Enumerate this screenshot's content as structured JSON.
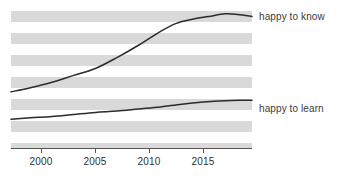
{
  "chart_data": {
    "type": "line",
    "title": "",
    "subtitle": "",
    "xlabel": "",
    "ylabel": "",
    "xlim": [
      1997.2,
      1919.5
    ],
    "x_range": [
      1997.2,
      2019.5
    ],
    "ylim": [
      0,
      100
    ],
    "grid": "horizontal-alternating-bands",
    "legend_position": "right-of-plot-inline",
    "x_tick_labels": [
      "2000",
      "2005",
      "2010",
      "2015"
    ],
    "x_ticks": [
      2000,
      2005,
      2010,
      2015
    ],
    "y_tick_labels": [],
    "series": [
      {
        "name": "happy to know",
        "label": "happy to know",
        "color": "#2b2b2b",
        "x": [
          1997.2,
          1999,
          2001,
          2003,
          2005,
          2007,
          2009,
          2011,
          2012.5,
          2014,
          2015.5,
          2017,
          2018.2,
          2019.5
        ],
        "values": [
          41,
          44,
          48,
          53,
          58,
          66,
          75,
          85,
          91,
          94,
          96,
          98,
          97.5,
          96
        ]
      },
      {
        "name": "happy to learn",
        "label": "happy to learn",
        "color": "#2b2b2b",
        "x": [
          1997.2,
          1999,
          2001,
          2003,
          2005,
          2007,
          2009,
          2011,
          2013,
          2015,
          2017,
          2018.5,
          2019.5
        ],
        "values": [
          21,
          22,
          23,
          24.5,
          26,
          27,
          28.5,
          30,
          32,
          33.5,
          34.5,
          34.8,
          34.8
        ]
      }
    ],
    "annotations": []
  },
  "chart_style": {
    "band_color": "#d9d9d9",
    "background_color": "#ffffff",
    "axis_color": "#555555",
    "line_color": "#2b2b2b",
    "tick_label_color": "#2f2f2f",
    "series_label_color": "#3b3b3b"
  }
}
